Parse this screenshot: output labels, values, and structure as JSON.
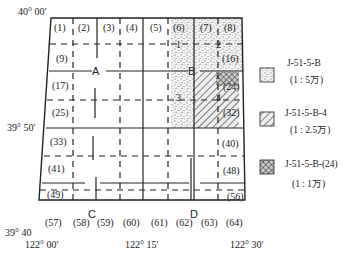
{
  "diagram": {
    "coords": {
      "top_left_lat": "40° 00′",
      "mid_left_lat": "39° 50′",
      "bottom_left_lat": "39° 40",
      "lon_left": "122° 00′",
      "lon_mid": "122° 15′",
      "lon_right": "122° 30′"
    },
    "quadrants": {
      "a": "A",
      "b": "B",
      "c": "C",
      "d": "D"
    },
    "sub_labels": {
      "b1": "1",
      "b2": "2",
      "b3": "3",
      "b4": "4"
    },
    "cells": {
      "c1": "(1)",
      "c2": "(2)",
      "c3": "(3)",
      "c4": "(4)",
      "c5": "(5)",
      "c6": "(6)",
      "c7": "(7)",
      "c8": "(8)",
      "c9": "(9)",
      "c16": "(16)",
      "c17": "(17)",
      "c24": "(24)",
      "c25": "(25)",
      "c32": "(32)",
      "c33": "(33)",
      "c40": "(40)",
      "c41": "(41)",
      "c48": "(48)",
      "c49": "(49)",
      "c56": "(56)",
      "c57": "(57)",
      "c58": "(58)",
      "c59": "(59)",
      "c60": "(60)",
      "c61": "(61)",
      "c62": "(62)",
      "c63": "(63)",
      "c64": "(64)"
    }
  },
  "legend": {
    "items": [
      {
        "code": "J-51-5-B",
        "scale": "(1 : 5万)",
        "pattern": "dots"
      },
      {
        "code": "J-51-5-B-4",
        "scale": "(1 : 2.5万)",
        "pattern": "hatch"
      },
      {
        "code": "J-51-5-B-(24)",
        "scale": "(1 : 1万)",
        "pattern": "crosshatch"
      }
    ]
  }
}
